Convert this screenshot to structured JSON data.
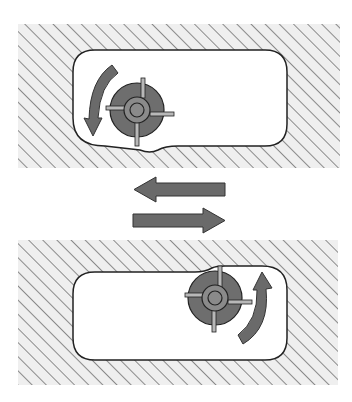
{
  "diagram": {
    "colors": {
      "background": "#ffffff",
      "hatch_fill": "#efefef",
      "hatch_line": "#555555",
      "pocket_fill": "#ffffff",
      "pocket_outline": "#222222",
      "cutter_body": "#6e6e6e",
      "cutter_hub": "#8a8a8a",
      "cutter_tooth": "#b8b8b8",
      "arrow_fill": "#6a6a6a",
      "arrow_outline": "#333333"
    },
    "panels": [
      {
        "id": "top",
        "workpiece": {
          "x": 18,
          "y": 24,
          "w": 322,
          "h": 144
        },
        "pocket": {
          "x": 73,
          "y": 50,
          "w": 214,
          "h": 96,
          "r": 22
        },
        "cutter": {
          "cx": 137,
          "cy": 110,
          "r": 27,
          "hub_r": 13,
          "bore_r": 7
        },
        "rotation": "counter-clockwise",
        "rotation_arrow_side": "left"
      },
      {
        "id": "bottom",
        "workpiece": {
          "x": 18,
          "y": 240,
          "w": 320,
          "h": 145
        },
        "pocket": {
          "x": 73,
          "y": 268,
          "w": 214,
          "h": 92,
          "r": 22
        },
        "cutter": {
          "cx": 215,
          "cy": 298,
          "r": 27,
          "hub_r": 13,
          "bore_r": 7
        },
        "rotation": "clockwise",
        "rotation_arrow_side": "right"
      }
    ],
    "feed_arrows": [
      {
        "id": "feed-left",
        "direction": "left",
        "x1": 133,
        "x2": 225,
        "y": 189
      },
      {
        "id": "feed-right",
        "direction": "right",
        "x1": 133,
        "x2": 225,
        "y": 220
      }
    ]
  }
}
